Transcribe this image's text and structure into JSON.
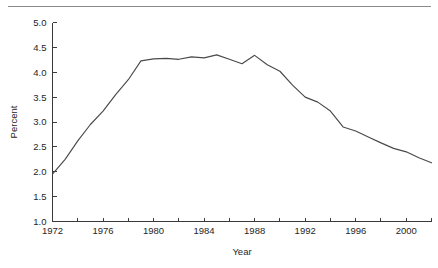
{
  "figure": {
    "top_rule_visible": true,
    "background_color": "#ffffff",
    "line_color": "#4a4a4a",
    "axis_color": "#3a3a3a",
    "text_color": "#262626"
  },
  "labels": {
    "y_axis_title": "Percent",
    "x_axis_title": "Year",
    "y_ticks": [
      "1.0",
      "1.5",
      "2.0",
      "2.5",
      "3.0",
      "3.5",
      "4.0",
      "4.5",
      "5.0"
    ],
    "x_ticks": [
      "1972",
      "1976",
      "1980",
      "1984",
      "1988",
      "1992",
      "1996",
      "2000"
    ]
  },
  "chart_data": {
    "type": "line",
    "title": "",
    "subtitle": "",
    "xlabel": "Year",
    "ylabel": "Percent",
    "xlim": [
      1972,
      2002
    ],
    "ylim": [
      1.0,
      5.0
    ],
    "y_tick_values": [
      1.0,
      1.5,
      2.0,
      2.5,
      3.0,
      3.5,
      4.0,
      4.5,
      5.0
    ],
    "x_tick_values": [
      1972,
      1974,
      1976,
      1978,
      1980,
      1982,
      1984,
      1986,
      1988,
      1990,
      1992,
      1994,
      1996,
      1998,
      2000,
      2002
    ],
    "x_tick_labeled": [
      1972,
      1976,
      1980,
      1984,
      1988,
      1992,
      1996,
      2000
    ],
    "grid": false,
    "legend": false,
    "legend_position": "none",
    "series": [
      {
        "name": "Percent",
        "x": [
          1972,
          1973,
          1974,
          1975,
          1976,
          1977,
          1978,
          1979,
          1980,
          1981,
          1982,
          1983,
          1984,
          1985,
          1986,
          1987,
          1988,
          1989,
          1990,
          1991,
          1992,
          1993,
          1994,
          1995,
          1996,
          1997,
          1998,
          1999,
          2000,
          2001,
          2002
        ],
        "values": [
          1.95,
          2.25,
          2.62,
          2.95,
          3.22,
          3.55,
          3.85,
          4.23,
          4.27,
          4.28,
          4.26,
          4.31,
          4.29,
          4.35,
          4.26,
          4.17,
          4.34,
          4.15,
          4.02,
          3.74,
          3.5,
          3.4,
          3.22,
          2.9,
          2.82,
          2.7,
          2.58,
          2.47,
          2.4,
          2.28,
          2.18
        ]
      }
    ]
  }
}
